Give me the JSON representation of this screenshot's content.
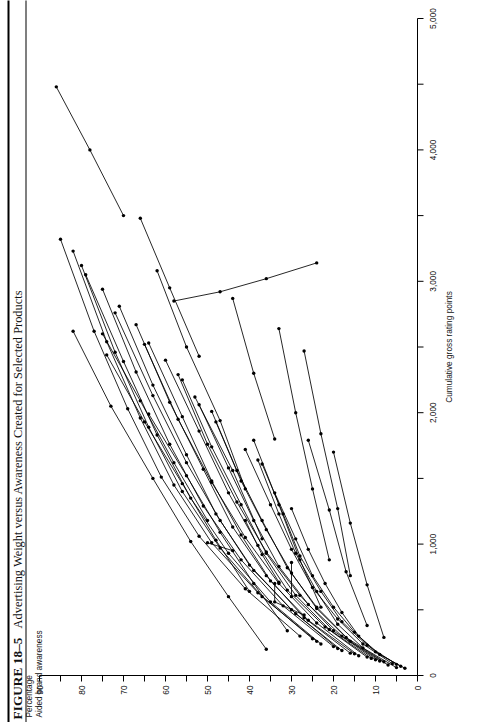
{
  "figure": {
    "number": "FIGURE 18–5",
    "title": "Advertising Weight versus Awareness Created for Selected Products"
  },
  "chart_data": {
    "type": "line",
    "title": "Advertising Weight versus Awareness Created for Selected Products",
    "xlabel": "Cumulative gross rating points",
    "ylabel": "Percentage\nAided brand awareness",
    "ylabel_line1": "Percentage",
    "ylabel_line2": "Aided brand awareness",
    "xlim": [
      0,
      5000
    ],
    "ylim": [
      0,
      90
    ],
    "xticks": [
      0,
      500,
      1000,
      1500,
      2000,
      2500,
      3000,
      3500,
      4000,
      4500,
      5000
    ],
    "xticklabels": [
      "0",
      "",
      "1,000",
      "",
      "2,000",
      "",
      "3,000",
      "",
      "4,000",
      "",
      "5,000"
    ],
    "yticks": [
      0,
      5,
      10,
      15,
      20,
      25,
      30,
      35,
      40,
      45,
      50,
      55,
      60,
      65,
      70,
      75,
      80,
      85,
      90
    ],
    "yticklabels": [
      "0",
      "",
      "10",
      "",
      "20",
      "",
      "30",
      "",
      "40",
      "",
      "50",
      "",
      "60",
      "",
      "70",
      "",
      "80",
      "",
      "90"
    ],
    "grid": false,
    "legend": false,
    "marker": "dot",
    "line_color": "#000000",
    "series": [
      {
        "name": "product-01",
        "points": [
          [
            60,
            5
          ],
          [
            210,
            13
          ],
          [
            390,
            19
          ],
          [
            640,
            24
          ],
          [
            930,
            29
          ],
          [
            1230,
            33
          ],
          [
            1640,
            38
          ]
        ]
      },
      {
        "name": "product-02",
        "points": [
          [
            80,
            7
          ],
          [
            260,
            16
          ],
          [
            520,
            24
          ],
          [
            820,
            31
          ],
          [
            1180,
            37
          ],
          [
            1560,
            43
          ],
          [
            2010,
            49
          ]
        ]
      },
      {
        "name": "product-03",
        "points": [
          [
            120,
            10
          ],
          [
            340,
            20
          ],
          [
            610,
            28
          ],
          [
            940,
            36
          ],
          [
            1320,
            43
          ],
          [
            1760,
            50
          ],
          [
            2290,
            57
          ]
        ]
      },
      {
        "name": "product-04",
        "points": [
          [
            150,
            14
          ],
          [
            400,
            24
          ],
          [
            700,
            33
          ],
          [
            1050,
            41
          ],
          [
            1470,
            49
          ],
          [
            1950,
            57
          ],
          [
            2520,
            65
          ]
        ]
      },
      {
        "name": "product-05",
        "points": [
          [
            190,
            18
          ],
          [
            470,
            29
          ],
          [
            800,
            39
          ],
          [
            1180,
            47
          ],
          [
            1620,
            55
          ],
          [
            2130,
            63
          ],
          [
            2760,
            72
          ]
        ]
      },
      {
        "name": "product-06",
        "points": [
          [
            240,
            23
          ],
          [
            560,
            35
          ],
          [
            930,
            45
          ],
          [
            1350,
            54
          ],
          [
            1830,
            62
          ],
          [
            2390,
            70
          ],
          [
            3050,
            79
          ]
        ]
      },
      {
        "name": "product-07",
        "points": [
          [
            300,
            28
          ],
          [
            660,
            41
          ],
          [
            1060,
            52
          ],
          [
            1510,
            61
          ],
          [
            2030,
            69
          ],
          [
            2620,
            77
          ],
          [
            3320,
            85
          ]
        ]
      },
      {
        "name": "product-08",
        "points": [
          [
            70,
            4
          ],
          [
            180,
            10
          ],
          [
            330,
            15
          ],
          [
            520,
            20
          ],
          [
            760,
            25
          ],
          [
            1040,
            29
          ],
          [
            1390,
            34
          ]
        ]
      },
      {
        "name": "product-09",
        "points": [
          [
            90,
            6
          ],
          [
            240,
            13
          ],
          [
            430,
            19
          ],
          [
            670,
            25
          ],
          [
            960,
            30
          ],
          [
            1300,
            35
          ],
          [
            1720,
            41
          ]
        ]
      },
      {
        "name": "product-10",
        "points": [
          [
            110,
            9
          ],
          [
            300,
            18
          ],
          [
            540,
            26
          ],
          [
            830,
            33
          ],
          [
            1180,
            39
          ],
          [
            1580,
            45
          ],
          [
            2060,
            52
          ]
        ]
      },
      {
        "name": "product-11",
        "points": [
          [
            140,
            12
          ],
          [
            370,
            22
          ],
          [
            650,
            31
          ],
          [
            990,
            38
          ],
          [
            1390,
            45
          ],
          [
            1860,
            52
          ],
          [
            2400,
            60
          ]
        ]
      },
      {
        "name": "product-12",
        "points": [
          [
            170,
            16
          ],
          [
            440,
            27
          ],
          [
            760,
            36
          ],
          [
            1130,
            44
          ],
          [
            1570,
            51
          ],
          [
            2080,
            59
          ],
          [
            2670,
            67
          ]
        ]
      },
      {
        "name": "product-13",
        "points": [
          [
            220,
            20
          ],
          [
            530,
            32
          ],
          [
            880,
            42
          ],
          [
            1290,
            51
          ],
          [
            1760,
            59
          ],
          [
            2310,
            67
          ],
          [
            2940,
            75
          ]
        ]
      },
      {
        "name": "product-14",
        "points": [
          [
            280,
            25
          ],
          [
            630,
            38
          ],
          [
            1010,
            49
          ],
          [
            1450,
            58
          ],
          [
            1960,
            66
          ],
          [
            2540,
            74
          ],
          [
            3230,
            82
          ]
        ]
      },
      {
        "name": "product-15",
        "points": [
          [
            55,
            3
          ],
          [
            160,
            9
          ],
          [
            300,
            14
          ],
          [
            480,
            18
          ],
          [
            700,
            22
          ],
          [
            960,
            26
          ],
          [
            1270,
            30
          ]
        ]
      },
      {
        "name": "product-16",
        "points": [
          [
            85,
            5
          ],
          [
            230,
            12
          ],
          [
            410,
            18
          ],
          [
            640,
            23
          ],
          [
            910,
            28
          ],
          [
            1230,
            32
          ],
          [
            1610,
            37
          ]
        ]
      },
      {
        "name": "product-17",
        "points": [
          [
            105,
            8
          ],
          [
            290,
            17
          ],
          [
            510,
            24
          ],
          [
            780,
            30
          ],
          [
            1110,
            36
          ],
          [
            1480,
            42
          ],
          [
            1930,
            48
          ]
        ]
      },
      {
        "name": "product-18",
        "points": [
          [
            130,
            11
          ],
          [
            350,
            21
          ],
          [
            610,
            29
          ],
          [
            930,
            36
          ],
          [
            1300,
            42
          ],
          [
            1740,
            49
          ],
          [
            2250,
            56
          ]
        ]
      },
      {
        "name": "product-19",
        "points": [
          [
            165,
            15
          ],
          [
            420,
            26
          ],
          [
            720,
            35
          ],
          [
            1070,
            42
          ],
          [
            1480,
            49
          ],
          [
            1970,
            56
          ],
          [
            2530,
            64
          ]
        ]
      },
      {
        "name": "product-20",
        "points": [
          [
            205,
            19
          ],
          [
            500,
            30
          ],
          [
            840,
            40
          ],
          [
            1230,
            48
          ],
          [
            1680,
            55
          ],
          [
            2210,
            63
          ],
          [
            2810,
            71
          ]
        ]
      },
      {
        "name": "product-21",
        "points": [
          [
            260,
            24
          ],
          [
            600,
            37
          ],
          [
            970,
            47
          ],
          [
            1400,
            56
          ],
          [
            1890,
            64
          ],
          [
            2460,
            72
          ],
          [
            3120,
            80
          ]
        ]
      },
      {
        "name": "product-22",
        "points": [
          [
            600,
            30
          ],
          [
            860,
            30
          ]
        ]
      },
      {
        "name": "product-23",
        "points": [
          [
            950,
            44
          ],
          [
            1010,
            50
          ]
        ]
      },
      {
        "name": "product-24",
        "points": [
          [
            710,
            33
          ],
          [
            920,
            37
          ],
          [
            1180,
            41
          ]
        ]
      },
      {
        "name": "product-25",
        "points": [
          [
            1040,
            37
          ],
          [
            1560,
            44
          ],
          [
            2120,
            53
          ]
        ]
      },
      {
        "name": "product-26",
        "points": [
          [
            520,
            23
          ],
          [
            880,
            28
          ],
          [
            1300,
            33
          ],
          [
            1790,
            39
          ]
        ]
      },
      {
        "name": "product-27",
        "points": [
          [
            1420,
            41
          ],
          [
            1940,
            47
          ],
          [
            2500,
            55
          ],
          [
            3080,
            62
          ]
        ]
      },
      {
        "name": "product-28",
        "points": [
          [
            2430,
            52
          ],
          [
            2950,
            59
          ],
          [
            3480,
            66
          ]
        ]
      },
      {
        "name": "product-29",
        "points": [
          [
            3500,
            70
          ],
          [
            4000,
            78
          ],
          [
            4480,
            86
          ]
        ]
      },
      {
        "name": "product-30",
        "points": [
          [
            380,
            12
          ],
          [
            790,
            17
          ],
          [
            1260,
            21
          ],
          [
            1790,
            26
          ]
        ]
      },
      {
        "name": "product-31",
        "points": [
          [
            290,
            8
          ],
          [
            690,
            12
          ],
          [
            1160,
            16
          ],
          [
            1700,
            20
          ]
        ]
      },
      {
        "name": "product-32",
        "points": [
          [
            460,
            27
          ],
          [
            560,
            34
          ],
          [
            700,
            34
          ]
        ]
      },
      {
        "name": "product-33",
        "points": [
          [
            2850,
            58
          ],
          [
            2920,
            47
          ],
          [
            3020,
            36
          ],
          [
            3140,
            24
          ]
        ]
      },
      {
        "name": "product-34",
        "points": [
          [
            880,
            21
          ],
          [
            1420,
            25
          ],
          [
            2000,
            29
          ],
          [
            2640,
            33
          ]
        ]
      },
      {
        "name": "product-35",
        "points": [
          [
            200,
            36
          ],
          [
            600,
            45
          ],
          [
            1020,
            54
          ],
          [
            1500,
            63
          ],
          [
            2050,
            73
          ],
          [
            2620,
            82
          ]
        ]
      },
      {
        "name": "product-36",
        "points": [
          [
            1180,
            50
          ],
          [
            1620,
            58
          ],
          [
            2090,
            66
          ],
          [
            2600,
            75
          ]
        ]
      },
      {
        "name": "product-37",
        "points": [
          [
            640,
            40
          ],
          [
            1030,
            48
          ],
          [
            1460,
            56
          ],
          [
            1930,
            65
          ],
          [
            2440,
            74
          ]
        ]
      },
      {
        "name": "product-38",
        "points": [
          [
            340,
            31
          ],
          [
            700,
            39
          ],
          [
            1090,
            47
          ],
          [
            1520,
            55
          ],
          [
            1990,
            64
          ]
        ]
      },
      {
        "name": "product-39",
        "points": [
          [
            1800,
            34
          ],
          [
            2300,
            39
          ],
          [
            2870,
            44
          ]
        ]
      },
      {
        "name": "product-40",
        "points": [
          [
            760,
            16
          ],
          [
            1270,
            19
          ],
          [
            1840,
            23
          ],
          [
            2470,
            27
          ]
        ]
      }
    ]
  }
}
